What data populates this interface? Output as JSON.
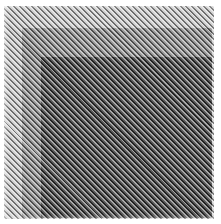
{
  "image": {
    "description": "Abstract pattern of fine diagonal stripes over nested squares of increasing darkness",
    "colors": {
      "background": "#ffffff",
      "outer_square": "#c8c8c8",
      "middle_square": "#8a8a8a",
      "inner_square": "#3e3e3e"
    },
    "stripe_angle_deg": 45
  }
}
